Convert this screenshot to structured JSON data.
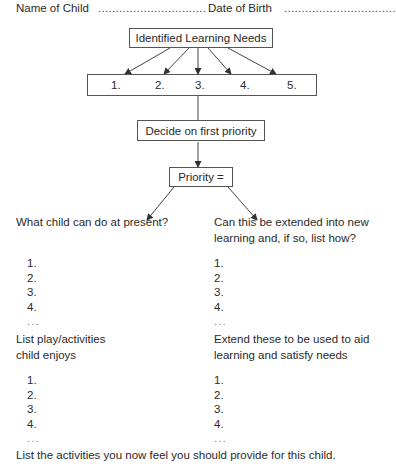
{
  "header": {
    "name_label": "Name of Child",
    "name_dots": "...............................",
    "dob_label": "Date of Birth",
    "dob_dots": "................................"
  },
  "flow": {
    "needs_title": "Identified Learning Needs",
    "needs_numbers": [
      "1.",
      "2.",
      "3.",
      "4.",
      "5."
    ],
    "decide": "Decide on first priority",
    "priority": "Priority ="
  },
  "sections": {
    "current": {
      "heading": "What child can do at present?",
      "items": [
        "1.",
        "2.",
        "3.",
        "4.",
        "..."
      ]
    },
    "extend": {
      "heading_line1": "Can this be extended into new",
      "heading_line2": "learning and, if so, list how?",
      "items": [
        "1.",
        "2.",
        "3.",
        "4.",
        "..."
      ]
    },
    "play": {
      "heading_line1": "List play/activities",
      "heading_line2": "child enjoys",
      "items": [
        "1.",
        "2.",
        "3.",
        "4.",
        "..."
      ]
    },
    "aid": {
      "heading_line1": "Extend these to be used to aid",
      "heading_line2": "learning and satisfy needs",
      "items": [
        "1.",
        "2.",
        "3.",
        "4.",
        "..."
      ]
    }
  },
  "footer": {
    "text": "List the activities you now feel you should provide for this child."
  }
}
